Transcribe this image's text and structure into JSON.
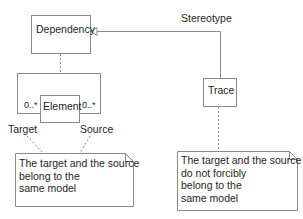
{
  "diagram": {
    "type": "uml-class-diagram",
    "classes": {
      "dependency": {
        "name": "Dependency"
      },
      "element": {
        "name": "Element"
      },
      "trace": {
        "name": "Trace"
      }
    },
    "relations": {
      "stereotype_label": "Stereotype",
      "target_multiplicity": "0..*",
      "source_multiplicity": "0..*",
      "target_role": "Target",
      "source_role": "Source"
    },
    "notes": {
      "left": {
        "lines": [
          "The target and the source",
          "belong to the",
          "same model"
        ]
      },
      "right": {
        "lines": [
          "The target and the source",
          "do not forcibly",
          "belong to the",
          "same model"
        ]
      }
    },
    "colors": {
      "line": "#8a8a8a",
      "text": "#1e1e1e",
      "background": "#ffffff"
    }
  }
}
